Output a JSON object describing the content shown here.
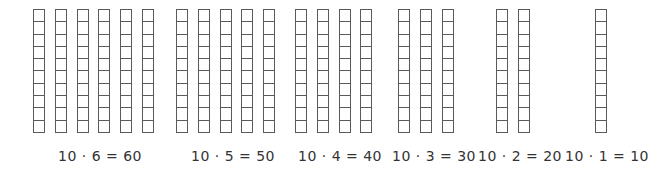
{
  "figure": {
    "rod_length": 10,
    "groups": [
      {
        "tens": 6,
        "equation": "10 · 6 = 60",
        "factor": 10,
        "multiplier": 6,
        "product": 60
      },
      {
        "tens": 5,
        "equation": "10 · 5 = 50",
        "factor": 10,
        "multiplier": 5,
        "product": 50
      },
      {
        "tens": 4,
        "equation": "10 · 4 = 40",
        "factor": 10,
        "multiplier": 4,
        "product": 40
      },
      {
        "tens": 3,
        "equation": "10 · 3 = 30",
        "factor": 10,
        "multiplier": 3,
        "product": 30
      },
      {
        "tens": 2,
        "equation": "10 · 2 = 20",
        "factor": 10,
        "multiplier": 2,
        "product": 20
      },
      {
        "tens": 1,
        "equation": "10 · 1 = 10",
        "factor": 10,
        "multiplier": 1,
        "product": 10
      }
    ],
    "colors": {
      "rod_outline": "#5a5a5a",
      "text": "#333333"
    }
  }
}
